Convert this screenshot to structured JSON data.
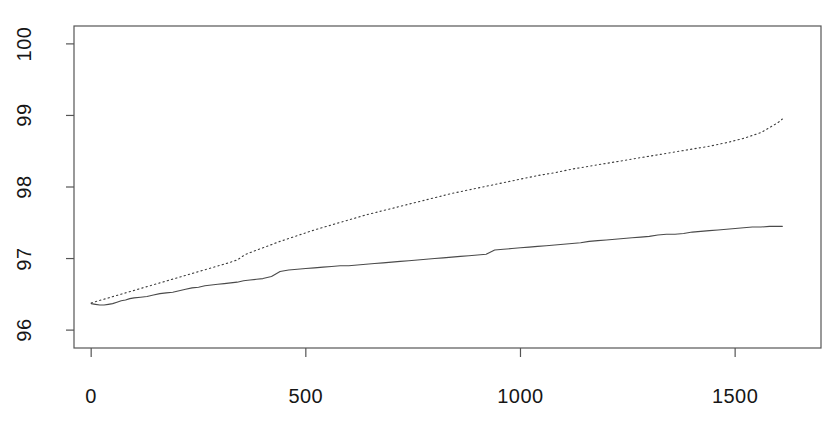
{
  "chart_data": {
    "type": "line",
    "title": "",
    "subtitle": "",
    "xlabel": "",
    "ylabel": "",
    "xlim": [
      -40,
      1700
    ],
    "ylim": [
      95.75,
      100.25
    ],
    "xticks": [
      0,
      500,
      1000,
      1500
    ],
    "xticklabels": [
      "0",
      "500",
      "1000",
      "1500"
    ],
    "yticks": [
      96,
      97,
      98,
      99,
      100
    ],
    "yticklabels": [
      "96",
      "97",
      "98",
      "99",
      "100"
    ],
    "grid": false,
    "legend": "none",
    "box": true,
    "background": "#ffffff",
    "axis_color": "#555555",
    "series": [
      {
        "name": "solid",
        "style": "solid",
        "color": "#4a4a4a",
        "width": 1.1,
        "x": [
          0,
          10,
          20,
          30,
          40,
          50,
          60,
          70,
          80,
          90,
          100,
          115,
          130,
          145,
          160,
          175,
          190,
          205,
          220,
          235,
          250,
          265,
          280,
          295,
          310,
          325,
          340,
          355,
          370,
          385,
          400,
          420,
          440,
          460,
          480,
          500,
          520,
          540,
          560,
          580,
          600,
          620,
          640,
          660,
          680,
          700,
          720,
          740,
          760,
          780,
          800,
          820,
          840,
          860,
          880,
          900,
          920,
          940,
          960,
          980,
          1000,
          1020,
          1040,
          1060,
          1080,
          1100,
          1120,
          1140,
          1160,
          1180,
          1200,
          1220,
          1240,
          1260,
          1280,
          1300,
          1320,
          1340,
          1360,
          1380,
          1400,
          1420,
          1440,
          1460,
          1480,
          1500,
          1520,
          1540,
          1560,
          1580,
          1600,
          1610
        ],
        "y": [
          96.37,
          96.36,
          96.35,
          96.35,
          96.36,
          96.37,
          96.39,
          96.41,
          96.42,
          96.44,
          96.45,
          96.46,
          96.47,
          96.49,
          96.51,
          96.52,
          96.53,
          96.55,
          96.57,
          96.59,
          96.6,
          96.62,
          96.63,
          96.64,
          96.65,
          96.66,
          96.67,
          96.69,
          96.7,
          96.71,
          96.72,
          96.75,
          96.82,
          96.84,
          96.85,
          96.86,
          96.87,
          96.88,
          96.89,
          96.9,
          96.9,
          96.91,
          96.92,
          96.93,
          96.94,
          96.95,
          96.96,
          96.97,
          96.98,
          96.99,
          97.0,
          97.01,
          97.02,
          97.03,
          97.04,
          97.05,
          97.06,
          97.12,
          97.13,
          97.14,
          97.15,
          97.16,
          97.17,
          97.18,
          97.19,
          97.2,
          97.21,
          97.22,
          97.24,
          97.25,
          97.26,
          97.27,
          97.28,
          97.29,
          97.3,
          97.31,
          97.33,
          97.34,
          97.34,
          97.35,
          97.37,
          97.38,
          97.39,
          97.4,
          97.41,
          97.42,
          97.43,
          97.44,
          97.44,
          97.45,
          97.45,
          97.45
        ]
      },
      {
        "name": "dotted",
        "style": "dotted",
        "color": "#3d3d3d",
        "width": 1.1,
        "x": [
          0,
          40,
          80,
          120,
          160,
          200,
          240,
          280,
          320,
          340,
          360,
          400,
          440,
          480,
          520,
          560,
          600,
          640,
          680,
          720,
          760,
          800,
          840,
          880,
          920,
          960,
          1000,
          1040,
          1080,
          1120,
          1160,
          1200,
          1240,
          1280,
          1320,
          1360,
          1400,
          1440,
          1480,
          1520,
          1560,
          1600,
          1610
        ],
        "y": [
          96.38,
          96.45,
          96.52,
          96.59,
          96.66,
          96.73,
          96.8,
          96.87,
          96.94,
          96.98,
          97.06,
          97.15,
          97.24,
          97.32,
          97.4,
          97.47,
          97.54,
          97.61,
          97.67,
          97.73,
          97.79,
          97.85,
          97.91,
          97.96,
          98.01,
          98.06,
          98.11,
          98.16,
          98.2,
          98.25,
          98.29,
          98.33,
          98.37,
          98.41,
          98.45,
          98.49,
          98.53,
          98.57,
          98.62,
          98.68,
          98.76,
          98.9,
          98.95
        ]
      }
    ]
  },
  "axes": {
    "x_tick_labels": [
      "0",
      "500",
      "1000",
      "1500"
    ],
    "y_tick_labels": [
      "96",
      "97",
      "98",
      "99",
      "100"
    ]
  }
}
